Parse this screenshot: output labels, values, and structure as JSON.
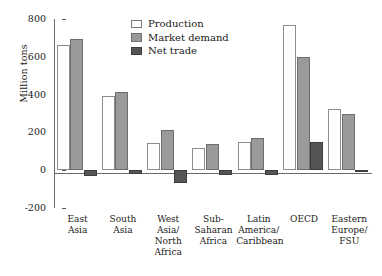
{
  "chart_data": {
    "type": "bar",
    "title": "",
    "xlabel": "",
    "ylabel": "Million tons",
    "ylim": [
      -200,
      800
    ],
    "yticks": [
      800,
      600,
      400,
      200,
      0,
      -200
    ],
    "ytick_labels": [
      "800",
      "600",
      "400",
      "200",
      "0",
      "-200"
    ],
    "grid": false,
    "legend_position": "top-center",
    "categories": [
      "East\nAsia",
      "South\nAsia",
      "West\nAsia/\nNorth\nAfrica",
      "Sub-\nSaharan\nAfrica",
      "Latin\nAmerica/\nCaribbean",
      "OECD",
      "Eastern\nEurope/\nFSU"
    ],
    "series": [
      {
        "name": "Production",
        "color": "#ffffff",
        "values": [
          660,
          393,
          146,
          115,
          150,
          770,
          325
        ]
      },
      {
        "name": "Market demand",
        "color": "#9a9a9a",
        "values": [
          692,
          413,
          215,
          140,
          172,
          600,
          300
        ]
      },
      {
        "name": "Net trade",
        "color": "#555555",
        "values": [
          -33,
          -22,
          -68,
          -25,
          -24,
          150,
          -10
        ]
      }
    ]
  },
  "legend": {
    "items": [
      {
        "label": "Production",
        "swatch": "production"
      },
      {
        "label": "Market demand",
        "swatch": "demand"
      },
      {
        "label": "Net trade",
        "swatch": "nettrade"
      }
    ]
  },
  "axes": {
    "y_title": "Million tons"
  }
}
